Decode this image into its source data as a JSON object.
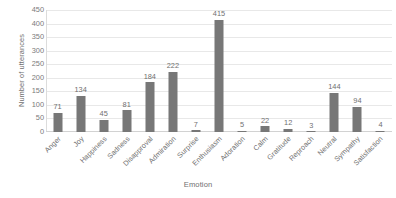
{
  "chart_data": {
    "type": "bar",
    "title": "",
    "xlabel": "Emotion",
    "ylabel": "Number of utterances",
    "categories": [
      "Anger",
      "Joy",
      "Happiness",
      "Sadness",
      "Disapproval",
      "Admiration",
      "Surprise",
      "Enthusiasm",
      "Adoration",
      "Calm",
      "Gratitude",
      "Reproach",
      "Neutral",
      "Sympathy",
      "Satisfaction"
    ],
    "values": [
      71,
      134,
      45,
      81,
      184,
      222,
      7,
      415,
      5,
      22,
      12,
      3,
      144,
      94,
      4
    ],
    "data_labels": [
      "71",
      "134",
      "45",
      "81",
      "184",
      "222",
      "7",
      "415",
      "5",
      "22",
      "12",
      "3",
      "144",
      "94",
      "4"
    ],
    "ylim": [
      0,
      450
    ],
    "ytick_labels": [
      "0",
      "50",
      "100",
      "150",
      "200",
      "250",
      "300",
      "350",
      "400",
      "450"
    ],
    "ytick_values": [
      0,
      50,
      100,
      150,
      200,
      250,
      300,
      350,
      400,
      450
    ],
    "grid": true,
    "grid_axis": "y",
    "legend": false,
    "legend_position": "none",
    "bar_color": "#777777",
    "gridline_color": "#e8e8e8",
    "text_color": "#6f6f6f",
    "background_color": "#ffffff",
    "xtick_rotation": -45
  }
}
